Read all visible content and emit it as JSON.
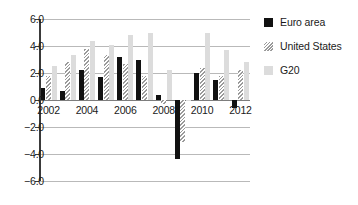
{
  "chart_data": {
    "type": "bar",
    "title": "",
    "xlabel": "",
    "ylabel": "",
    "ylim": [
      -6.0,
      6.0
    ],
    "grid": true,
    "legend_position": "right",
    "categories": [
      "2002",
      "2003",
      "2004",
      "2005",
      "2006",
      "2007",
      "2008",
      "2009",
      "2010",
      "2011",
      "2012"
    ],
    "tick_labels_x": [
      "2002",
      "2004",
      "2006",
      "2008",
      "2010",
      "2012"
    ],
    "tick_labels_y": [
      "6.0",
      "4.0",
      "2.0",
      "0.0",
      "-2.0",
      "-4.0",
      "-6.0"
    ],
    "tick_values_y": [
      6.0,
      4.0,
      2.0,
      0.0,
      -2.0,
      -4.0,
      -6.0
    ],
    "series": [
      {
        "name": "Euro area",
        "color": "#111111",
        "fill": "solid",
        "values": [
          0.9,
          0.7,
          2.2,
          1.7,
          3.2,
          3.0,
          0.4,
          -4.4,
          2.0,
          1.5,
          -0.6
        ]
      },
      {
        "name": "United States",
        "color": "#9a9a9a",
        "fill": "hatched",
        "values": [
          1.8,
          2.8,
          3.8,
          3.3,
          2.7,
          1.8,
          -0.3,
          -3.1,
          2.4,
          1.8,
          2.2
        ]
      },
      {
        "name": "G20",
        "color": "#dcdcdc",
        "fill": "solid",
        "values": [
          2.5,
          3.3,
          4.4,
          4.1,
          4.8,
          5.0,
          2.2,
          -0.1,
          5.0,
          3.7,
          2.8
        ]
      }
    ]
  },
  "legend": {
    "items": [
      {
        "label": "Euro area",
        "swatch": "euro"
      },
      {
        "label": "United States",
        "swatch": "us"
      },
      {
        "label": "G20",
        "swatch": "g20"
      }
    ]
  }
}
